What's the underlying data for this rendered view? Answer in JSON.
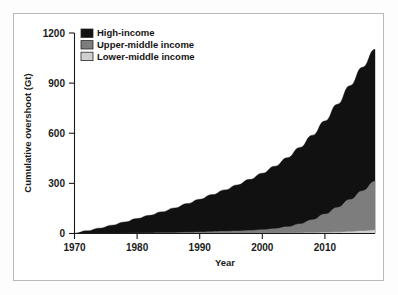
{
  "figure": {
    "background": "#ffffff",
    "border_color": "#b9b9b9"
  },
  "chart_data": {
    "type": "area",
    "stacked": true,
    "title": "",
    "subtitle": "",
    "xlabel": "Year",
    "ylabel": "Cumulative overshoot (Gt)",
    "xlim": [
      1970,
      2018
    ],
    "ylim": [
      0,
      1200
    ],
    "xticks": [
      1970,
      1980,
      1990,
      2000,
      2010
    ],
    "yticks": [
      0,
      300,
      600,
      900,
      1200
    ],
    "grid": false,
    "legend_position": "top-left",
    "x": [
      1970,
      1972,
      1974,
      1976,
      1978,
      1980,
      1982,
      1984,
      1986,
      1988,
      1990,
      1992,
      1994,
      1996,
      1998,
      2000,
      2002,
      2004,
      2006,
      2008,
      2010,
      2012,
      2014,
      2016,
      2018
    ],
    "series": [
      {
        "name": "Lower-middle income",
        "color": "#cfcfcf",
        "values": [
          0,
          0,
          0,
          0,
          0,
          0,
          0,
          0,
          0,
          0,
          0,
          0,
          0,
          0,
          0,
          1,
          1,
          2,
          3,
          4,
          6,
          8,
          11,
          15,
          20
        ]
      },
      {
        "name": "Upper-middle income",
        "color": "#7d7d7d",
        "values": [
          0,
          0,
          0,
          0,
          1,
          2,
          3,
          4,
          5,
          7,
          9,
          11,
          13,
          15,
          18,
          22,
          28,
          38,
          54,
          78,
          110,
          148,
          192,
          240,
          292
        ]
      },
      {
        "name": "High-income",
        "color": "#111111",
        "values": [
          2,
          16,
          32,
          50,
          68,
          88,
          106,
          126,
          148,
          172,
          196,
          222,
          248,
          276,
          306,
          338,
          374,
          414,
          458,
          506,
          558,
          618,
          682,
          740,
          790
        ]
      }
    ],
    "totals": [
      2,
      16,
      32,
      50,
      69,
      90,
      109,
      130,
      153,
      179,
      205,
      233,
      261,
      291,
      324,
      361,
      403,
      454,
      515,
      588,
      674,
      774,
      885,
      995,
      1102
    ]
  },
  "legend": {
    "items": [
      {
        "label": "High-income",
        "swatch": "#111111"
      },
      {
        "label": "Upper-middle income",
        "swatch": "#7d7d7d"
      },
      {
        "label": "Lower-middle income",
        "swatch": "#cfcfcf"
      }
    ]
  }
}
